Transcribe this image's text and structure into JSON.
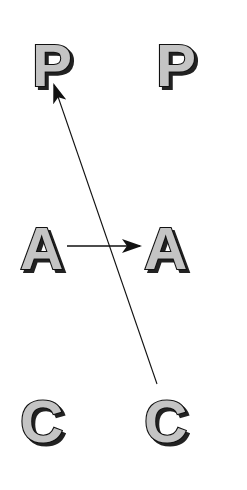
{
  "diagram": {
    "left_column": {
      "top": "P",
      "middle": "A",
      "bottom": "C"
    },
    "right_column": {
      "top": "P",
      "middle": "A",
      "bottom": "C"
    },
    "arrows": [
      {
        "from": "left A",
        "to": "right A",
        "direction": "horizontal"
      },
      {
        "from": "right C",
        "to": "left P",
        "direction": "diagonal"
      }
    ],
    "colors": {
      "letter_fill": "#c4c4c4",
      "letter_outline": "#111111",
      "arrow": "#111111",
      "background": "#ffffff"
    }
  }
}
